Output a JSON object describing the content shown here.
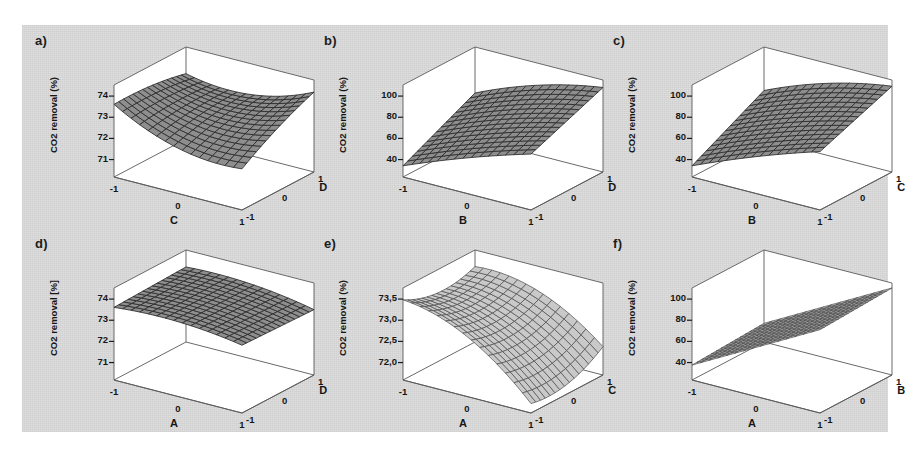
{
  "figure": {
    "background_color": "#dcdcdc",
    "page_color": "#ffffff",
    "panel_count": 6
  },
  "chart_data": [
    {
      "id": "a",
      "type": "surface",
      "panel_label": "a)",
      "title": "",
      "zlabel": "CO2 removal (%)",
      "xlabel": "C",
      "ylabel": "D",
      "zticks": [
        "74",
        "73",
        "72",
        "71"
      ],
      "zvalues": [
        74,
        73,
        72,
        71
      ],
      "zlim": [
        70.6,
        74.4
      ],
      "xticks": [
        "-1",
        "0",
        "1"
      ],
      "yticks": [
        "-1",
        "0",
        "1"
      ],
      "xlim": [
        -1,
        1
      ],
      "ylim": [
        -1,
        1
      ],
      "surface_style": "dark-wireframe",
      "shape": "saddle",
      "description": "Curved saddle surface, low near centre front, rising toward the right-back corner",
      "grid": "on",
      "legend": "none",
      "corner_values": {
        "x-1_y-1": 73.6,
        "x1_y-1": 72.3,
        "x-1_y1": 73.3,
        "x1_y1": 73.9
      }
    },
    {
      "id": "b",
      "type": "surface",
      "panel_label": "b)",
      "title": "",
      "zlabel": "CO2 removal (%)",
      "xlabel": "B",
      "ylabel": "D",
      "zticks": [
        "100",
        "80",
        "60",
        "40"
      ],
      "zvalues": [
        100,
        80,
        60,
        40
      ],
      "zlim": [
        33,
        107
      ],
      "xticks": [
        "-1",
        "0",
        "1"
      ],
      "yticks": [
        "-1",
        "0",
        "1"
      ],
      "xlim": [
        -1,
        1
      ],
      "ylim": [
        -1,
        1
      ],
      "surface_style": "dark-wireframe",
      "shape": "twisted-ruled",
      "description": "Twisted ruled surface rising from the low front-left corner to the high right-back corner",
      "grid": "on",
      "legend": "none",
      "corner_values": {
        "x-1_y-1": 42,
        "x1_y-1": 78,
        "x-1_y1": 70,
        "x1_y1": 101
      }
    },
    {
      "id": "c",
      "type": "surface",
      "panel_label": "c)",
      "title": "",
      "zlabel": "CO2 removal (%)",
      "xlabel": "B",
      "ylabel": "C",
      "zticks": [
        "100",
        "80",
        "60",
        "40"
      ],
      "zvalues": [
        100,
        80,
        60,
        40
      ],
      "zlim": [
        33,
        107
      ],
      "xticks": [
        "-1",
        "0",
        "1"
      ],
      "yticks": [
        "-1",
        "0",
        "1"
      ],
      "xlim": [
        -1,
        1
      ],
      "ylim": [
        -1,
        1
      ],
      "surface_style": "dark-wireframe",
      "shape": "twisted-ruled",
      "description": "Twisted ruled surface rising from the low front-left corner toward the high right-back corner",
      "grid": "on",
      "legend": "none",
      "corner_values": {
        "x-1_y-1": 42,
        "x1_y-1": 80,
        "x-1_y1": 72,
        "x1_y1": 102
      }
    },
    {
      "id": "d",
      "type": "surface",
      "panel_label": "d)",
      "title": "",
      "zlabel": "CO2 removal [%]",
      "xlabel": "A",
      "ylabel": "D",
      "zticks": [
        "74",
        "73",
        "72",
        "71"
      ],
      "zvalues": [
        74,
        73,
        72,
        71
      ],
      "zlim": [
        70.6,
        74.4
      ],
      "xticks": [
        "-1",
        "0",
        "1"
      ],
      "yticks": [
        "-1",
        "0",
        "1"
      ],
      "xlim": [
        -1,
        1
      ],
      "ylim": [
        -1,
        1
      ],
      "surface_style": "dark-wireframe",
      "shape": "near-planar",
      "description": "Almost flat slightly warped sheet near 73.5, seen nearly edge-on",
      "grid": "on",
      "legend": "none",
      "corner_values": {
        "x-1_y-1": 73.6,
        "x1_y-1": 73.4,
        "x-1_y1": 73.7,
        "x1_y1": 73.3
      }
    },
    {
      "id": "e",
      "type": "surface",
      "panel_label": "e)",
      "title": "",
      "zlabel": "CO2 removal (%)",
      "xlabel": "A",
      "ylabel": "C",
      "zticks": [
        "73,5",
        "73,0",
        "72,5",
        "72,0"
      ],
      "zvalues": [
        73.5,
        73.0,
        72.5,
        72.0
      ],
      "zlim": [
        71.8,
        73.75
      ],
      "xticks": [
        "-1",
        "0",
        "1"
      ],
      "yticks": [
        "-1",
        "0",
        "1"
      ],
      "xlim": [
        -1,
        1
      ],
      "ylim": [
        -1,
        1
      ],
      "surface_style": "light-mesh",
      "shape": "curved-descending",
      "description": "Curved surface high at the back edge, descending steeply toward the front-right corner",
      "grid": "on",
      "legend": "none",
      "corner_values": {
        "x-1_y-1": 73.5,
        "x1_y-1": 72.0,
        "x-1_y1": 73.4,
        "x1_y1": 72.4
      }
    },
    {
      "id": "f",
      "type": "surface",
      "panel_label": "f)",
      "title": "",
      "zlabel": "CO2 removal (%)",
      "xlabel": "A",
      "ylabel": "B",
      "zticks": [
        "100",
        "80",
        "60",
        "40"
      ],
      "zvalues": [
        100,
        80,
        60,
        40
      ],
      "zlim": [
        33,
        107
      ],
      "xticks": [
        "-1",
        "0",
        "1"
      ],
      "yticks": [
        "-1",
        "0",
        "1"
      ],
      "xlim": [
        -1,
        1
      ],
      "ylim": [
        -1,
        1
      ],
      "surface_style": "light-mesh",
      "shape": "planar",
      "description": "Flat tilted plane rising linearly with A, nearly independent of B",
      "grid": "on",
      "legend": "none",
      "corner_values": {
        "x-1_y-1": 45,
        "x1_y-1": 100,
        "x-1_y1": 48,
        "x1_y1": 103
      }
    }
  ]
}
